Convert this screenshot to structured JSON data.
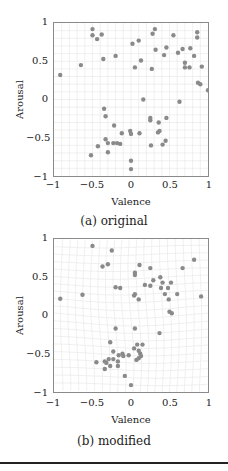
{
  "figure": {
    "panels": [
      {
        "id": "a",
        "caption": "(a) original",
        "xlabel": "Valence",
        "ylabel": "Arousal",
        "xticks": [
          "−1",
          "−0.5",
          "0",
          "0.5",
          "1"
        ],
        "yticks": [
          "1",
          "0.5",
          "0",
          "−0.5",
          "−1"
        ]
      },
      {
        "id": "b",
        "caption": "(b) modified",
        "xlabel": "Valence",
        "ylabel": "Arousal",
        "xticks": [
          "−1",
          "−0.5",
          "0",
          "0.5",
          "1"
        ],
        "yticks": [
          "1",
          "0.5",
          "0",
          "−0.5",
          "−1"
        ]
      }
    ],
    "colors": {
      "point": "#8a8a8a",
      "grid": "#e6e6e6",
      "axis": "#8a8a8a"
    }
  },
  "chart_data": [
    {
      "type": "scatter",
      "title": "(a) original",
      "xlabel": "Valence",
      "ylabel": "Arousal",
      "xlim": [
        -1,
        1
      ],
      "ylim": [
        -1,
        1
      ],
      "grid": true,
      "legend": null,
      "points": [
        [
          -0.92,
          0.32
        ],
        [
          -0.65,
          0.45
        ],
        [
          -0.5,
          0.92
        ],
        [
          -0.5,
          0.84
        ],
        [
          -0.44,
          0.79
        ],
        [
          -0.38,
          0.85
        ],
        [
          -0.36,
          0.53
        ],
        [
          -0.2,
          0.57
        ],
        [
          0.02,
          0.73
        ],
        [
          0.05,
          0.42
        ],
        [
          0.1,
          0.77
        ],
        [
          0.13,
          0.51
        ],
        [
          0.27,
          0.4
        ],
        [
          0.28,
          0.86
        ],
        [
          0.31,
          0.92
        ],
        [
          0.32,
          0.65
        ],
        [
          0.43,
          0.58
        ],
        [
          0.46,
          0.68
        ],
        [
          0.55,
          0.84
        ],
        [
          0.61,
          0.61
        ],
        [
          0.67,
          0.66
        ],
        [
          0.7,
          0.48
        ],
        [
          0.7,
          0.42
        ],
        [
          0.76,
          0.42
        ],
        [
          0.77,
          0.67
        ],
        [
          0.82,
          0.57
        ],
        [
          0.86,
          0.88
        ],
        [
          0.86,
          0.81
        ],
        [
          0.87,
          0.22
        ],
        [
          0.9,
          0.2
        ],
        [
          0.92,
          0.43
        ],
        [
          1.0,
          0.12
        ],
        [
          0.16,
          0.0
        ],
        [
          0.63,
          -0.03
        ],
        [
          -0.35,
          -0.12
        ],
        [
          -0.33,
          -0.22
        ],
        [
          -0.22,
          -0.34
        ],
        [
          -0.33,
          -0.52
        ],
        [
          -0.3,
          -0.57
        ],
        [
          -0.23,
          -0.57
        ],
        [
          -0.18,
          -0.57
        ],
        [
          -0.14,
          -0.58
        ],
        [
          -0.12,
          -0.44
        ],
        [
          -0.01,
          -0.41
        ],
        [
          0.0,
          -0.45
        ],
        [
          0.11,
          -0.44
        ],
        [
          0.25,
          -0.24
        ],
        [
          0.25,
          -0.27
        ],
        [
          0.36,
          -0.3
        ],
        [
          0.35,
          -0.43
        ],
        [
          0.37,
          -0.41
        ],
        [
          0.46,
          -0.24
        ],
        [
          0.45,
          -0.54
        ],
        [
          0.41,
          -0.59
        ],
        [
          0.26,
          -0.6
        ],
        [
          -0.43,
          -0.61
        ],
        [
          -0.3,
          -0.69
        ],
        [
          -0.52,
          -0.73
        ],
        [
          0.0,
          -0.8
        ],
        [
          0.0,
          -0.91
        ]
      ]
    },
    {
      "type": "scatter",
      "title": "(b) modified",
      "xlabel": "Valence",
      "ylabel": "Arousal",
      "xlim": [
        -1,
        1
      ],
      "ylim": [
        -1,
        1
      ],
      "grid": true,
      "legend": null,
      "points": [
        [
          -0.92,
          0.22
        ],
        [
          -0.63,
          0.27
        ],
        [
          -0.5,
          0.91
        ],
        [
          -0.25,
          0.85
        ],
        [
          -0.3,
          0.67
        ],
        [
          -0.37,
          0.64
        ],
        [
          -0.2,
          0.37
        ],
        [
          -0.14,
          0.36
        ],
        [
          0.11,
          0.66
        ],
        [
          0.05,
          0.56
        ],
        [
          0.05,
          0.53
        ],
        [
          0.04,
          0.26
        ],
        [
          0.05,
          0.28
        ],
        [
          0.1,
          0.21
        ],
        [
          0.18,
          0.4
        ],
        [
          0.25,
          0.39
        ],
        [
          0.25,
          0.62
        ],
        [
          0.29,
          0.46
        ],
        [
          0.38,
          0.5
        ],
        [
          0.41,
          0.43
        ],
        [
          0.39,
          0.36
        ],
        [
          0.44,
          0.28
        ],
        [
          0.48,
          0.36
        ],
        [
          0.49,
          0.21
        ],
        [
          0.52,
          0.43
        ],
        [
          0.6,
          0.28
        ],
        [
          0.67,
          0.62
        ],
        [
          0.82,
          0.73
        ],
        [
          0.5,
          0.05
        ],
        [
          0.53,
          0.03
        ],
        [
          0.91,
          0.25
        ],
        [
          -0.2,
          -0.17
        ],
        [
          0.05,
          -0.17
        ],
        [
          0.37,
          -0.23
        ],
        [
          -0.27,
          -0.35
        ],
        [
          -0.23,
          -0.47
        ],
        [
          -0.11,
          -0.5
        ],
        [
          -0.1,
          -0.53
        ],
        [
          -0.03,
          -0.52
        ],
        [
          0.04,
          -0.43
        ],
        [
          0.08,
          -0.38
        ],
        [
          0.15,
          -0.38
        ],
        [
          0.1,
          -0.46
        ],
        [
          0.12,
          -0.5
        ],
        [
          0.13,
          -0.53
        ],
        [
          0.1,
          -0.56
        ],
        [
          0.07,
          -0.58
        ],
        [
          -0.16,
          -0.52
        ],
        [
          -0.17,
          -0.6
        ],
        [
          -0.23,
          -0.57
        ],
        [
          -0.29,
          -0.57
        ],
        [
          -0.32,
          -0.62
        ],
        [
          -0.34,
          -0.6
        ],
        [
          -0.45,
          -0.61
        ],
        [
          -0.27,
          -0.66
        ],
        [
          -0.17,
          -0.66
        ],
        [
          -0.34,
          -0.7
        ],
        [
          -0.08,
          -0.79
        ],
        [
          0.0,
          -0.91
        ]
      ]
    }
  ]
}
